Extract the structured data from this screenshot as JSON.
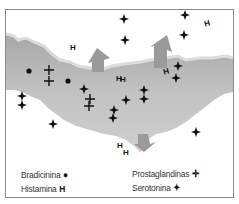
{
  "diagram": {
    "colors": {
      "tissue_light": "#c9c9c9",
      "tissue_mid": "#b0b0b0",
      "tissue_edge": "#d8d8d8",
      "arrow": "#9a9a9a",
      "symbol": "#111111",
      "border": "#8a8a8a"
    },
    "symbols": {
      "bradicinina": "circle",
      "histamina": "H",
      "prostaglandinas": "cross",
      "serotonina": "four-point-star"
    }
  },
  "legend": {
    "items": [
      {
        "label": "Bradicinina",
        "symbol": "●"
      },
      {
        "label": "Histamina",
        "symbol": "H"
      },
      {
        "label": "Prostaglandinas",
        "symbol": "✛"
      },
      {
        "label": "Serotonina",
        "symbol": "✦"
      }
    ]
  }
}
